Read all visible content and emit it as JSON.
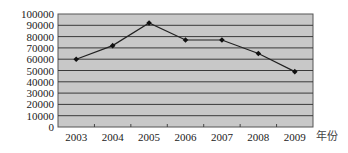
{
  "chart_data": {
    "type": "line",
    "title": "",
    "xlabel": "年份",
    "ylabel": "",
    "categories": [
      "2003",
      "2004",
      "2005",
      "2006",
      "2007",
      "2008",
      "2009"
    ],
    "series": [
      {
        "name": "",
        "values": [
          60000,
          72000,
          92000,
          77000,
          77000,
          65000,
          49000
        ]
      }
    ],
    "ylim": [
      0,
      100000
    ],
    "yticks": [
      0,
      10000,
      20000,
      30000,
      40000,
      50000,
      60000,
      70000,
      80000,
      90000,
      100000
    ],
    "grid": true,
    "legend": null,
    "colors": {
      "plot_background": "#c8c8c8",
      "gridline": "#3a3a3a",
      "line": "#222222",
      "marker": "#111111"
    }
  }
}
